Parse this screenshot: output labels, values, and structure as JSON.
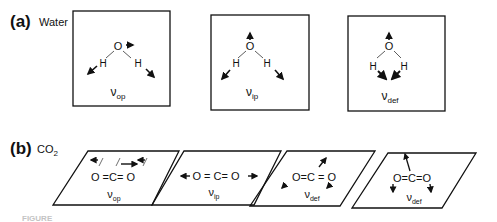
{
  "panels": {
    "a": {
      "label": "(a)",
      "title": "Water",
      "modes": [
        {
          "name": "ν",
          "sub": "op"
        },
        {
          "name": "ν",
          "sub": "ip"
        },
        {
          "name": "ν",
          "sub": "def"
        }
      ],
      "atoms": {
        "O": "O",
        "H": "H"
      }
    },
    "b": {
      "label": "(b)",
      "title": "CO",
      "title_sub": "2",
      "modes": [
        {
          "name": "ν",
          "sub": "op"
        },
        {
          "name": "ν",
          "sub": "ip"
        },
        {
          "name": "ν",
          "sub": "def"
        },
        {
          "name": "ν",
          "sub": "def"
        }
      ],
      "molecule": "O = C = O"
    }
  },
  "caption": "FIGURE"
}
